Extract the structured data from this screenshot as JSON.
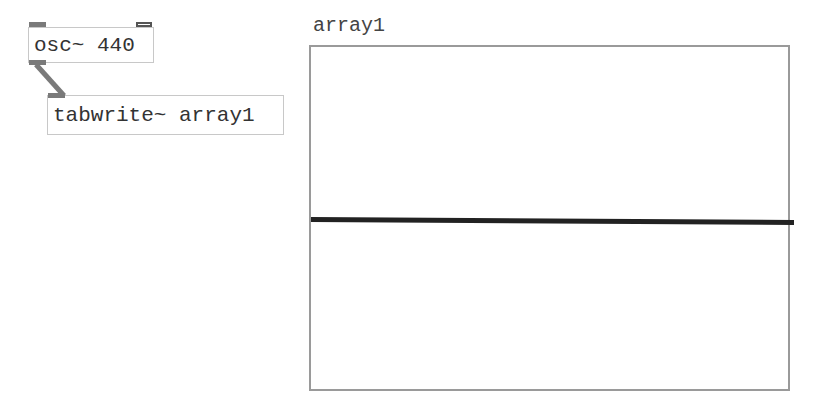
{
  "patch": {
    "objects": [
      {
        "id": "osc",
        "text": "osc~ 440"
      },
      {
        "id": "tabwrite",
        "text": "tabwrite~ array1"
      }
    ],
    "array": {
      "name": "array1",
      "plot_value": 0
    },
    "colors": {
      "box_border": "#c8c8c8",
      "inlet": "#7a7a7a",
      "graph_border": "#9a9a9a",
      "plot_line": "#222222"
    }
  }
}
